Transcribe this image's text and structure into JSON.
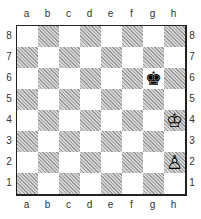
{
  "board": {
    "files": [
      "a",
      "b",
      "c",
      "d",
      "e",
      "f",
      "g",
      "h"
    ],
    "ranks": [
      "8",
      "7",
      "6",
      "5",
      "4",
      "3",
      "2",
      "1"
    ],
    "pieces": [
      {
        "square": "g6",
        "piece": "black-king",
        "glyph": "♚"
      },
      {
        "square": "h4",
        "piece": "white-king",
        "glyph": "♔"
      },
      {
        "square": "h2",
        "piece": "white-pawn",
        "glyph": "♙"
      }
    ],
    "colors": {
      "light": "#ffffff",
      "dark": "#c8c8c8",
      "border": "#222222"
    }
  }
}
